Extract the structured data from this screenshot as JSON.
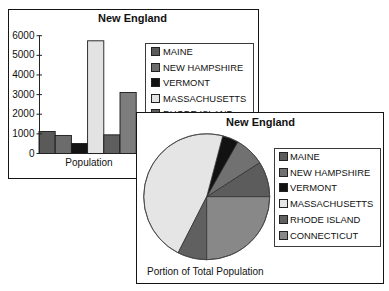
{
  "chart_data": [
    {
      "type": "bar",
      "title": "New England",
      "xlabel": "Population",
      "ylabel": "",
      "categories": [
        "Population"
      ],
      "ylim": [
        0,
        6000
      ],
      "yticks": [
        6000,
        5000,
        4000,
        3000,
        2000,
        1000,
        0
      ],
      "ytick_labels": [
        "6000",
        "5000",
        "4000",
        "3000",
        "2000",
        "1000",
        "0"
      ],
      "grid": false,
      "legend_position": "right",
      "series": [
        {
          "name": "MAINE",
          "values": [
            1120
          ],
          "color": "#5a5a5a"
        },
        {
          "name": "NEW HAMPSHIRE",
          "values": [
            920
          ],
          "color": "#6c6c6c"
        },
        {
          "name": "VERMONT",
          "values": [
            510
          ],
          "color": "#121212"
        },
        {
          "name": "MASSACHUSETTS",
          "values": [
            5740
          ],
          "color": "#e3e3e3"
        },
        {
          "name": "RHODE ISLAND",
          "values": [
            950
          ],
          "color": "#5e5e5e"
        },
        {
          "name": "CONNECTICUT",
          "values": [
            3110
          ],
          "color": "#7d7d7d"
        }
      ]
    },
    {
      "type": "pie",
      "title": "New England",
      "caption": "Portion of Total Population",
      "labels": [
        "MAINE",
        "NEW HAMPSHIRE",
        "VERMONT",
        "MASSACHUSETTS",
        "RHODE ISLAND",
        "CONNECTICUT"
      ],
      "values": [
        9.1,
        7.7,
        4.1,
        46.6,
        7.5,
        25.0
      ],
      "colors": [
        "#5c5c5c",
        "#717171",
        "#121212",
        "#e5e5e5",
        "#606060",
        "#888888"
      ],
      "start_angle_deg": 0,
      "direction": "counterclockwise",
      "legend_position": "right"
    }
  ]
}
